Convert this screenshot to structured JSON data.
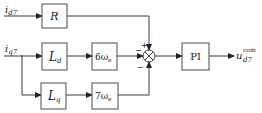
{
  "diagram": {
    "type": "block-diagram",
    "inputs": {
      "top": {
        "symbol": "i",
        "sub": "d7"
      },
      "bottom": {
        "symbol": "i",
        "sub": "q7"
      }
    },
    "blocks": {
      "R": {
        "label": "R"
      },
      "Ld": {
        "symbol": "L",
        "sub": "d"
      },
      "Lq": {
        "symbol": "L",
        "sub": "q"
      },
      "w6": {
        "coef": "6ω",
        "sub": "e"
      },
      "w7": {
        "coef": "7ω",
        "sub": "e"
      },
      "PI": {
        "label": "PI"
      }
    },
    "junction": {
      "signs": {
        "top": "+",
        "left": "−",
        "bottom": "−"
      }
    },
    "output": {
      "symbol": "u",
      "sub": "d7",
      "sup": "com"
    },
    "colors": {
      "line": "#3a3a3a",
      "text": "#222222",
      "background": "#ffffff"
    }
  }
}
